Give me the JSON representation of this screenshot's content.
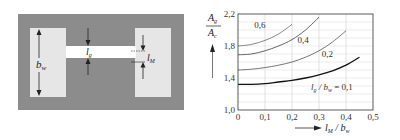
{
  "diagram": {
    "labels": {
      "bw": "b",
      "bw_sub": "w",
      "lg": "l",
      "lg_sub": "g",
      "lM": "l",
      "lM_sub": "M"
    },
    "colors": {
      "core": "#8c8c8c",
      "window": "#e6e6e6",
      "gap": "#ffffff",
      "arrow": "#222222"
    }
  },
  "chart_data": {
    "type": "line",
    "title": "",
    "xlabel": "l_M / b_w",
    "ylabel": "A_g / A_c",
    "xlabel_parts": {
      "main": "l",
      "sub": "M",
      "sep": " / ",
      "main2": "b",
      "sub2": "w"
    },
    "ylabel_parts": {
      "num": "A",
      "num_sub": "g",
      "den": "A",
      "den_sub": "c"
    },
    "xlim": [
      0,
      0.5
    ],
    "ylim": [
      1.0,
      2.2
    ],
    "xticks": [
      0,
      0.1,
      0.2,
      0.3,
      0.4,
      0.5
    ],
    "xtick_labels": [
      "0",
      "0,1",
      "0,2",
      "0,3",
      "0,4",
      "0,5"
    ],
    "yticks": [
      1.0,
      1.4,
      1.8,
      2.2
    ],
    "ytick_labels": [
      "1,0",
      "1,4",
      "1,8",
      "2,2"
    ],
    "grid": true,
    "grid_y_minor": [
      1.1,
      1.2,
      1.3,
      1.5,
      1.6,
      1.7,
      1.9,
      2.0,
      2.1
    ],
    "legend": "inline",
    "series": [
      {
        "name": "0,6",
        "param": 0.6,
        "color": "#777777",
        "x": [
          0,
          0.05,
          0.1,
          0.15,
          0.2
        ],
        "y": [
          1.8,
          1.82,
          1.87,
          1.95,
          2.07
        ]
      },
      {
        "name": "0,4",
        "param": 0.4,
        "color": "#555555",
        "x": [
          0,
          0.05,
          0.1,
          0.15,
          0.2,
          0.25,
          0.3
        ],
        "y": [
          1.69,
          1.7,
          1.74,
          1.8,
          1.88,
          2.0,
          2.16
        ]
      },
      {
        "name": "0,2",
        "param": 0.2,
        "color": "#666666",
        "x": [
          0,
          0.05,
          0.1,
          0.15,
          0.2,
          0.25,
          0.3,
          0.35,
          0.4
        ],
        "y": [
          1.5,
          1.51,
          1.53,
          1.56,
          1.6,
          1.66,
          1.74,
          1.85,
          1.99
        ]
      },
      {
        "name": "l_g / b_w = 0,1",
        "param": 0.1,
        "color": "#111111",
        "x": [
          0,
          0.05,
          0.1,
          0.15,
          0.2,
          0.25,
          0.3,
          0.35,
          0.4,
          0.45
        ],
        "y": [
          1.32,
          1.32,
          1.33,
          1.35,
          1.37,
          1.4,
          1.44,
          1.49,
          1.56,
          1.66
        ]
      }
    ],
    "annotations": [
      {
        "text": "0,6",
        "x": 0.06,
        "y": 2.02
      },
      {
        "text": "0,4",
        "x": 0.22,
        "y": 1.84
      },
      {
        "text": "0,2",
        "x": 0.31,
        "y": 1.66
      },
      {
        "text_main": "l",
        "text_sub": "g",
        "text_rest": " / b",
        "text_sub2": "w",
        "text_tail": " = 0,1",
        "x": 0.27,
        "y": 1.25
      }
    ]
  }
}
